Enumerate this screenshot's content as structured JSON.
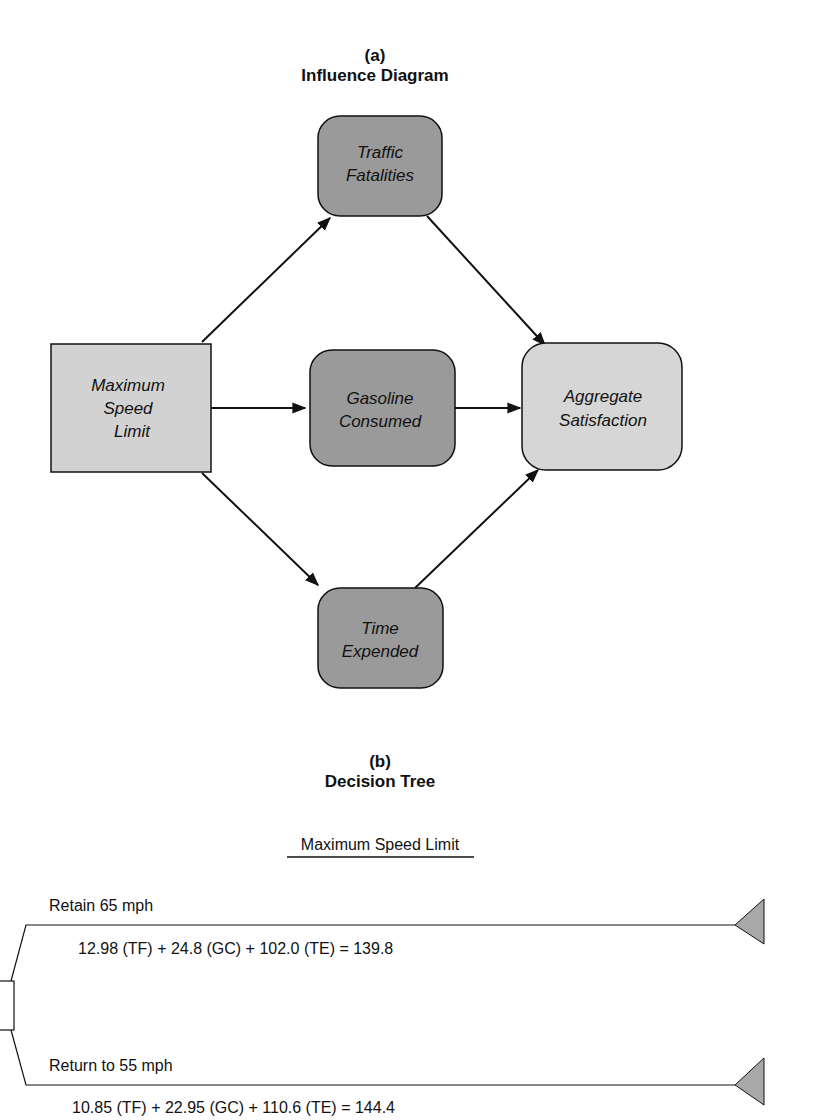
{
  "influence_diagram": {
    "label": "(a)",
    "title": "Influence Diagram",
    "colors": {
      "decision": "#d2d2d2",
      "chance": "#9a9a9a",
      "value": "#d6d6d6",
      "stroke": "#111111"
    },
    "nodes": {
      "max_speed": {
        "type": "decision",
        "lines": [
          "Maximum",
          "Speed",
          "Limit"
        ]
      },
      "traffic": {
        "type": "chance",
        "lines": [
          "Traffic",
          "Fatalities"
        ]
      },
      "gasoline": {
        "type": "chance",
        "lines": [
          "Gasoline",
          "Consumed"
        ]
      },
      "time": {
        "type": "chance",
        "lines": [
          "Time",
          "Expended"
        ]
      },
      "aggregate": {
        "type": "value",
        "lines": [
          "Aggregate",
          "Satisfaction"
        ]
      }
    },
    "edges": [
      {
        "from": "Maximum Speed Limit",
        "to": "Traffic Fatalities"
      },
      {
        "from": "Maximum Speed Limit",
        "to": "Gasoline Consumed"
      },
      {
        "from": "Maximum Speed Limit",
        "to": "Time Expended"
      },
      {
        "from": "Traffic Fatalities",
        "to": "Aggregate Satisfaction"
      },
      {
        "from": "Gasoline Consumed",
        "to": "Aggregate Satisfaction"
      },
      {
        "from": "Time Expended",
        "to": "Aggregate Satisfaction"
      }
    ]
  },
  "decision_tree": {
    "label": "(b)",
    "title": "Decision Tree",
    "decision_label": "Maximum Speed Limit",
    "branches": [
      {
        "label": "Retain 65 mph",
        "formula": "12.98 (TF) + 24.8 (GC) + 102.0 (TE) = 139.8"
      },
      {
        "label": "Return to 55 mph",
        "formula": "10.85 (TF) + 22.95 (GC) + 110.6 (TE) = 144.4"
      }
    ],
    "terminal_color": "#a8a8a8"
  }
}
